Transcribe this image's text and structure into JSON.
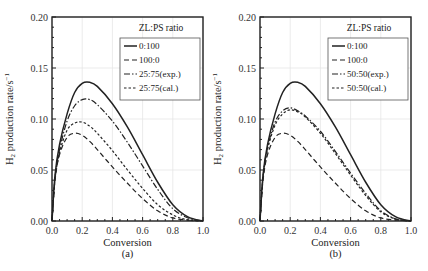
{
  "chart_data": [
    {
      "type": "line",
      "panel_label": "(a)",
      "title": "",
      "xlabel": "Conversion",
      "ylabel": "H2 production rate/s^-1",
      "xlim": [
        0.0,
        1.0
      ],
      "ylim": [
        0.0,
        0.2
      ],
      "x_ticks": [
        "0.0",
        "0.2",
        "0.4",
        "0.6",
        "0.8",
        "1.0"
      ],
      "y_ticks": [
        "0.00",
        "0.05",
        "0.10",
        "0.15",
        "0.20"
      ],
      "grid": true,
      "legend_title": "ZL:PS ratio",
      "legend_position": "upper right",
      "x": [
        0.0,
        0.02,
        0.05,
        0.1,
        0.15,
        0.2,
        0.25,
        0.3,
        0.4,
        0.5,
        0.6,
        0.7,
        0.8,
        0.9,
        1.0
      ],
      "series": [
        {
          "name": "0:100",
          "style": "solid",
          "values": [
            0.0,
            0.045,
            0.075,
            0.105,
            0.126,
            0.135,
            0.136,
            0.132,
            0.115,
            0.092,
            0.065,
            0.038,
            0.016,
            0.004,
            0.0
          ]
        },
        {
          "name": "100:0",
          "style": "dashed",
          "values": [
            0.0,
            0.04,
            0.065,
            0.082,
            0.086,
            0.084,
            0.078,
            0.07,
            0.053,
            0.037,
            0.022,
            0.01,
            0.003,
            0.001,
            0.0
          ]
        },
        {
          "name": "25:75(exp.)",
          "style": "dash-dot",
          "values": [
            0.0,
            0.042,
            0.07,
            0.098,
            0.113,
            0.119,
            0.119,
            0.114,
            0.098,
            0.077,
            0.054,
            0.031,
            0.012,
            0.003,
            0.0
          ]
        },
        {
          "name": "25:75(cal.)",
          "style": "dashed-short",
          "values": [
            0.0,
            0.041,
            0.067,
            0.089,
            0.096,
            0.097,
            0.093,
            0.086,
            0.069,
            0.05,
            0.032,
            0.016,
            0.006,
            0.001,
            0.0
          ]
        }
      ]
    },
    {
      "type": "line",
      "panel_label": "(b)",
      "title": "",
      "xlabel": "Conversion",
      "ylabel": "H2 production rate/s^-1",
      "xlim": [
        0.0,
        1.0
      ],
      "ylim": [
        0.0,
        0.2
      ],
      "x_ticks": [
        "0.0",
        "0.2",
        "0.4",
        "0.6",
        "0.8",
        "1.0"
      ],
      "y_ticks": [
        "0.00",
        "0.05",
        "0.10",
        "0.15",
        "0.20"
      ],
      "grid": true,
      "legend_title": "ZL:PS ratio",
      "legend_position": "upper right",
      "x": [
        0.0,
        0.02,
        0.05,
        0.1,
        0.15,
        0.2,
        0.25,
        0.3,
        0.4,
        0.5,
        0.6,
        0.7,
        0.8,
        0.9,
        1.0
      ],
      "series": [
        {
          "name": "0:100",
          "style": "solid",
          "values": [
            0.0,
            0.045,
            0.075,
            0.105,
            0.126,
            0.135,
            0.136,
            0.132,
            0.115,
            0.092,
            0.065,
            0.038,
            0.016,
            0.004,
            0.0
          ]
        },
        {
          "name": "100:0",
          "style": "dashed",
          "values": [
            0.0,
            0.04,
            0.065,
            0.082,
            0.086,
            0.084,
            0.078,
            0.07,
            0.053,
            0.037,
            0.022,
            0.01,
            0.003,
            0.001,
            0.0
          ]
        },
        {
          "name": "50:50(exp.)",
          "style": "dash-dot",
          "values": [
            0.0,
            0.043,
            0.072,
            0.097,
            0.108,
            0.111,
            0.108,
            0.103,
            0.088,
            0.068,
            0.047,
            0.027,
            0.01,
            0.002,
            0.0
          ]
        },
        {
          "name": "50:50(cal.)",
          "style": "dashed-short",
          "values": [
            0.0,
            0.042,
            0.07,
            0.094,
            0.105,
            0.109,
            0.107,
            0.102,
            0.086,
            0.066,
            0.045,
            0.025,
            0.009,
            0.002,
            0.0
          ]
        }
      ]
    }
  ]
}
